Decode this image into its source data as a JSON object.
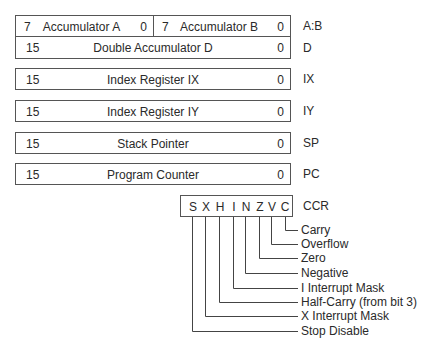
{
  "registers": {
    "ab": {
      "a": {
        "hi": "7",
        "name": "Accumulator A",
        "lo": "0"
      },
      "b": {
        "hi": "7",
        "name": "Accumulator B",
        "lo": "0"
      },
      "label": "A:B"
    },
    "d": {
      "hi": "15",
      "name": "Double Accumulator D",
      "lo": "0",
      "label": "D"
    },
    "ix": {
      "hi": "15",
      "name": "Index Register IX",
      "lo": "0",
      "label": "IX"
    },
    "iy": {
      "hi": "15",
      "name": "Index Register IY",
      "lo": "0",
      "label": "IY"
    },
    "sp": {
      "hi": "15",
      "name": "Stack Pointer",
      "lo": "0",
      "label": "SP"
    },
    "pc": {
      "hi": "15",
      "name": "Program Counter",
      "lo": "0",
      "label": "PC"
    }
  },
  "ccr": {
    "label": "CCR",
    "bits": [
      "S",
      "X",
      "H",
      "I",
      "N",
      "Z",
      "V",
      "C"
    ],
    "flags": [
      "Carry",
      "Overflow",
      "Zero",
      "Negative",
      "I Interrupt Mask",
      "Half-Carry (from bit 3)",
      "X Interrupt Mask",
      "Stop Disable"
    ]
  }
}
